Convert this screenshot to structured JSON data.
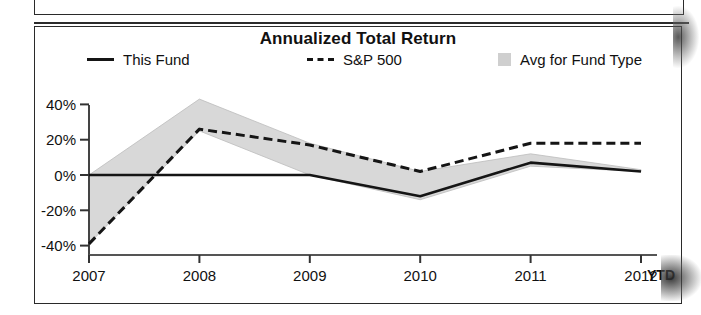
{
  "chart": {
    "title": "Annualized Total Return",
    "legend": [
      {
        "label": "This Fund",
        "marker": "solid-line"
      },
      {
        "label": "S&P 500",
        "marker": "dashed-line"
      },
      {
        "label": "Avg for Fund Type",
        "marker": "gray-square"
      }
    ],
    "axis": {
      "y_ticks": [
        "40%",
        "20%",
        "0%",
        "-20%",
        "-40%"
      ],
      "x_ticks": [
        "2007",
        "2008",
        "2009",
        "2010",
        "2011",
        "2012"
      ],
      "x_suffix": "YTD"
    },
    "colors": {
      "line": "#151515",
      "band_fill": "#d8d8d8",
      "frame": "#2a2a2a",
      "background": "#ffffff"
    }
  },
  "chart_data": {
    "type": "line",
    "title": "Annualized Total Return",
    "xlabel": "",
    "ylabel": "",
    "x": [
      "2007",
      "2008",
      "2009",
      "2010",
      "2011",
      "2012 YTD"
    ],
    "ylim": [
      -45,
      48
    ],
    "yticks": [
      -40,
      -20,
      0,
      20,
      40
    ],
    "grid": false,
    "legend_position": "top",
    "series": [
      {
        "name": "This Fund",
        "style": "solid",
        "values": [
          0,
          0,
          0,
          -12,
          7,
          2
        ]
      },
      {
        "name": "S&P 500",
        "style": "dashed",
        "values": [
          -39,
          26,
          17,
          2,
          18,
          18
        ]
      },
      {
        "name": "Avg for Fund Type",
        "style": "band",
        "band_upper": [
          0,
          43,
          18,
          2,
          12,
          3
        ],
        "band_lower": [
          -39,
          25,
          0,
          -14,
          5,
          2
        ]
      }
    ]
  }
}
